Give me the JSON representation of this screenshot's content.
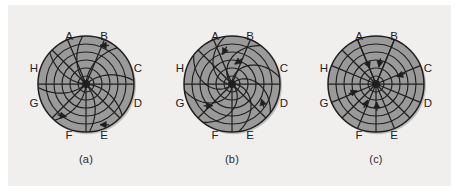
{
  "figure": {
    "background_color": "#f1efee",
    "page_color": "#ffffff",
    "disk_fill": "#9a9a9a",
    "line_color": "#1f1f1f",
    "label_color": "#232323",
    "panel_count": 3
  },
  "direction_labels": [
    "A",
    "B",
    "C",
    "D",
    "E",
    "F",
    "G",
    "H"
  ],
  "geometry": {
    "outer_radius": 48,
    "ring_radii": [
      8,
      16,
      24,
      32,
      40,
      48
    ],
    "ring_count": 6,
    "spoke_count": 8,
    "spoke_angles_deg": [
      67.5,
      112.5,
      0,
      315,
      270,
      225,
      180,
      135
    ],
    "center_dot_radius": 4
  },
  "panels": [
    {
      "id": "a",
      "caption": "(a)",
      "flow_type": "tangential-circulation",
      "arrow_count": 3,
      "arrows": [
        {
          "name": "arrow-b-tangential",
          "angle_deg": 70,
          "radius": 41,
          "direction": "clockwise-inward"
        },
        {
          "name": "arrow-f-tangential",
          "angle_deg": 239,
          "radius": 38,
          "direction": "clockwise-inward"
        },
        {
          "name": "arrow-e-tangential",
          "angle_deg": 289,
          "radius": 43,
          "direction": "counter-clockwise-inward"
        }
      ],
      "label_positions": {
        "A": [
          -17,
          -47
        ],
        "B": [
          18,
          -47
        ],
        "C": [
          52,
          -15
        ],
        "D": [
          52,
          20
        ],
        "E": [
          18,
          52
        ],
        "F": [
          -17,
          52
        ],
        "G": [
          -52,
          20
        ],
        "H": [
          -52,
          -15
        ]
      }
    },
    {
      "id": "b",
      "caption": "(b)",
      "flow_type": "spiral-inward",
      "arrow_count": 4,
      "arrows": [
        {
          "name": "arrow-a-spiral",
          "angle_deg": 108,
          "radius": 31,
          "direction": "spiral-inward"
        },
        {
          "name": "arrow-b-spiral",
          "angle_deg": 82,
          "radius": 20,
          "direction": "spiral-inward"
        },
        {
          "name": "arrow-d-spiral",
          "angle_deg": 333,
          "radius": 33,
          "direction": "spiral-inward"
        },
        {
          "name": "arrow-f-spiral",
          "angle_deg": 228,
          "radius": 29,
          "direction": "spiral-inward"
        }
      ],
      "label_positions": {
        "A": [
          -17,
          -47
        ],
        "B": [
          18,
          -47
        ],
        "C": [
          52,
          -15
        ],
        "D": [
          52,
          20
        ],
        "E": [
          18,
          52
        ],
        "F": [
          -17,
          52
        ],
        "G": [
          -52,
          20
        ],
        "H": [
          -52,
          -15
        ]
      }
    },
    {
      "id": "c",
      "caption": "(c)",
      "flow_type": "radial-convergence",
      "arrow_count": 6,
      "arrows": [
        {
          "name": "arrow-a-radial",
          "angle_deg": 112,
          "radius": 17,
          "direction": "inward"
        },
        {
          "name": "arrow-b-radial",
          "angle_deg": 80,
          "radius": 17,
          "direction": "inward"
        },
        {
          "name": "arrow-c-radial",
          "angle_deg": 20,
          "radius": 22,
          "direction": "inward"
        },
        {
          "name": "arrow-e-radial",
          "angle_deg": 272,
          "radius": 18,
          "direction": "inward"
        },
        {
          "name": "arrow-f-radial",
          "angle_deg": 243,
          "radius": 18,
          "direction": "inward"
        },
        {
          "name": "arrow-g-radial",
          "angle_deg": 200,
          "radius": 20,
          "direction": "inward"
        }
      ],
      "label_positions": {
        "A": [
          -17,
          -47
        ],
        "B": [
          18,
          -47
        ],
        "C": [
          52,
          -15
        ],
        "D": [
          52,
          20
        ],
        "E": [
          18,
          52
        ],
        "F": [
          -17,
          52
        ],
        "G": [
          -52,
          20
        ],
        "H": [
          -52,
          -15
        ]
      }
    }
  ]
}
